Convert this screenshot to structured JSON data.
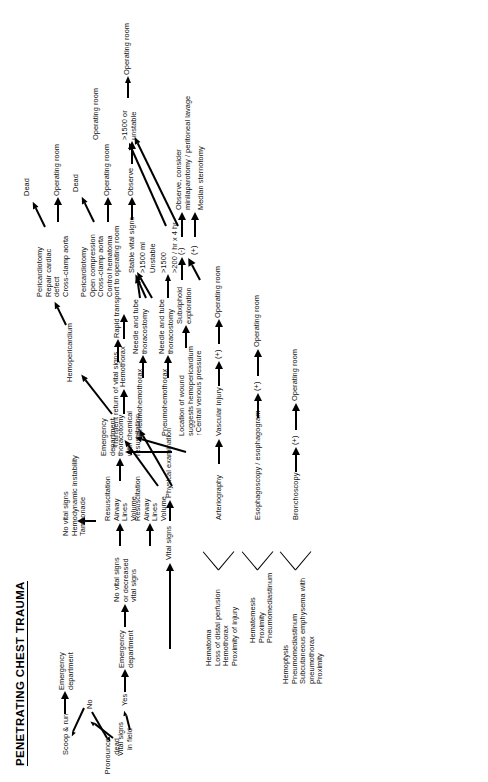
{
  "title": "PENETRATING CHEST TRAUMA",
  "nodes": {
    "vital_signs_field": "Vital signs\nin field",
    "no": "No",
    "yes": "Yes",
    "pronounce_dead": "Pronounce\ndead",
    "scoop_run": "Scoop & run",
    "ed1": "Emergency\ndepartment",
    "ed2": "Emergency\ndepartment",
    "no_vital_signs_decreased": "No vital signs\nor decreased\nvital signs",
    "vital_signs": "Vital signs",
    "physical_examination": "Physical examination",
    "resuscitation_a": "Resuscitation\nAirway\nLines\nVolume",
    "ed_thoracotomy": "Emergency\ndepartment\nthoracotomy\nwith chemical\nresuscitation",
    "hemopericardium": "Hemopericardium",
    "hemothorax": "Hemothorax",
    "tx_pericardiotomy_1": "Pericardiotomy\nRepair cardiac\n   defect\nCross-clamp aorta",
    "tx_pericardiotomy_2": "Pericardiotomy\nOpen compression\nCross-clamp aorta\nControl hematoma",
    "dead_1": "Dead",
    "operating_room_1": "Operating room",
    "dead_2": "Dead",
    "operating_room_2": "Operating room",
    "resuscitation_b": "Resuscitation\nAirway\nLines\nVolume",
    "no_vital_signs_block": "No vital signs\nHemodynamic instability\nTamponade",
    "transient_return": "Transient return of vital signs",
    "rapid_transport": "Rapid transport to operating room",
    "pneumohemothorax_1": "Pneumohemothorax",
    "needle_tube_1": "Needle and tube\nthoracostomy",
    "pneumohemothorax_2": "Pneumohemothorax",
    "needle_tube_2": "Needle and tube\nthoracostomy",
    "stable_vital_signs": "Stable vital signs",
    "gt1500ml": ">1500 ml",
    "unstable": "Unstable",
    "gt1500": ">1500",
    "gt200hr": ">200 / hr x 4 hr",
    "observe": "Observe",
    "gt1500_or_unstable": ">1500 or\nunstable",
    "operating_room_3": "Operating room",
    "operating_room_4": "Operating room",
    "location_of_wound": "Location of wound\nsuggests hemopericardium\n↑Central venous pressure",
    "subxiphoid_exploration": "Subxiphoid\nexploration",
    "minus": "(-)",
    "plus_subx": "(+)",
    "observe_consider": "Observe, consider\n   minilaparotomy / peritoneal lavage",
    "median_sternotomy": "Median sternotomy",
    "vascular_injury": "Vascular injury",
    "arteriography": "Arteriography",
    "plus_art": "(+)",
    "operating_room_5": "Operating room",
    "esophagoscopy": "Esophagoscopy / esophagogram",
    "plus_eso": "(+)",
    "operating_room_6": "Operating room",
    "bronchoscopy": "Bronchoscopy",
    "plus_bro": "(+)",
    "operating_room_7": "Operating room",
    "findings_vascular": "Hematoma\nLoss of distal perfusion\nHemothorax\nProximity of injury",
    "findings_esophageal": "Hematemesis\nProximity\nPneumomediastinum",
    "findings_tracheobronchial": "Hemoptysis\nPneumomediastinum\nSubcutaneous emphysema with\n   pneumothorax\nProximity"
  }
}
